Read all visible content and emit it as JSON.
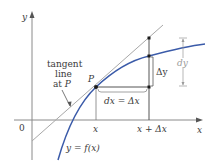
{
  "diagram": {
    "axes": {
      "x_label": "x",
      "y_label": "y",
      "origin_label": "0"
    },
    "tick_labels": {
      "x": "x",
      "x_plus_dx": "x + Δx"
    },
    "annotations": {
      "tangent_line_1": "tangent",
      "tangent_line_2": "line",
      "tangent_line_3_prefix": "at ",
      "tangent_line_3_point": "P",
      "point_P": "P",
      "dx_eq": "dx = Δx",
      "delta_y": "Δy",
      "dy": "dy",
      "function": "y = f(x)"
    },
    "colors": {
      "axis": "#8a8a8a",
      "curve": "#3b5ba9",
      "tangent": "#a8a8a8",
      "construction": "#555555",
      "point": "#1a1a1a",
      "dy_bracket": "#9a9a9a",
      "text": "#3a3a3a"
    }
  }
}
